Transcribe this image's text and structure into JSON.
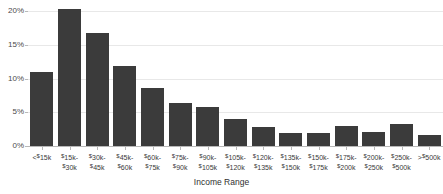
{
  "chart_data": {
    "type": "bar",
    "title": "",
    "subtitle": "",
    "xlabel": "Income Range",
    "ylabel": "",
    "ylim": [
      0,
      20
    ],
    "grid": true,
    "legend": false,
    "bar_color": "#3b3b3b",
    "grid_color": "#e8e8e8",
    "axis_color": "#b8b8b8",
    "background": "#ffffff",
    "y_ticks": [
      "0%",
      "5%",
      "10%",
      "15%",
      "20%"
    ],
    "y_tick_values": [
      0,
      5,
      10,
      15,
      20
    ],
    "categories": [
      "<$15k",
      "$15k-$30k",
      "$30k-$45k",
      "$45k-$60k",
      "$60k-$75k",
      "$75k-$90k",
      "$90k-$105k",
      "$105k-$120k",
      "$120k-$135k",
      "$135k-$150k",
      "$150k-$175k",
      "$175k-$200k",
      "$200k-$250k",
      "$250k-$500k",
      ">$500k"
    ],
    "category_lines": [
      {
        "l1": "<$15k",
        "l2": ""
      },
      {
        "l1": "$15k-",
        "l2": "$30k"
      },
      {
        "l1": "$30k-",
        "l2": "$45k"
      },
      {
        "l1": "$45k-",
        "l2": "$60k"
      },
      {
        "l1": "$60k-",
        "l2": "$75k"
      },
      {
        "l1": "$75k-",
        "l2": "$90k"
      },
      {
        "l1": "$90k-",
        "l2": "$105k"
      },
      {
        "l1": "$105k-",
        "l2": "$120k"
      },
      {
        "l1": "$120k-",
        "l2": "$135k"
      },
      {
        "l1": "$135k-",
        "l2": "$150k"
      },
      {
        "l1": "$150k-",
        "l2": "$175k"
      },
      {
        "l1": "$175k-",
        "l2": "$200k"
      },
      {
        "l1": "$200k-",
        "l2": "$250k"
      },
      {
        "l1": "$250k-",
        "l2": "$500k"
      },
      {
        "l1": ">$500k",
        "l2": ""
      }
    ],
    "values": [
      11.0,
      20.3,
      16.7,
      11.9,
      8.6,
      6.3,
      5.8,
      4.0,
      2.8,
      2.0,
      2.0,
      2.9,
      2.1,
      3.3,
      1.6
    ],
    "values_unit": "%"
  }
}
